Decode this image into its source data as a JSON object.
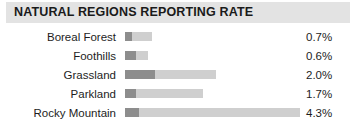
{
  "header": {
    "title": "NATURAL REGIONS REPORTING RATE",
    "band_color": "#e3e3e3",
    "text_color": "#1a1a1a"
  },
  "colors": {
    "bar_dark": "#8d8d8d",
    "bar_light": "#cfcfcf",
    "background": "#ffffff",
    "text": "#1d1d1d"
  },
  "chart_data": {
    "type": "bar",
    "title": "NATURAL REGIONS REPORTING RATE",
    "xlabel": "",
    "ylabel": "",
    "orientation": "horizontal",
    "grid": false,
    "legend": "none",
    "value_format": "percent",
    "xlim": [
      0,
      4.3
    ],
    "categories": [
      "Boreal Forest",
      "Foothills",
      "Grassland",
      "Parkland",
      "Rocky Mountain"
    ],
    "values": [
      0.7,
      0.6,
      2.0,
      1.7,
      4.3
    ],
    "value_labels": [
      "0.7%",
      "0.6%",
      "2.0%",
      "1.7%",
      "4.3%"
    ],
    "series": [
      {
        "name": "Reporting rate",
        "values": [
          0.7,
          0.6,
          2.0,
          1.7,
          4.3
        ]
      }
    ]
  },
  "rows": [
    {
      "label": "Boreal Forest",
      "value": "0.7%",
      "dark_px": 7,
      "light_left_px": 7,
      "light_width_px": 20
    },
    {
      "label": "Foothills",
      "value": "0.6%",
      "dark_px": 11,
      "light_left_px": 11,
      "light_width_px": 12
    },
    {
      "label": "Grassland",
      "value": "2.0%",
      "dark_px": 30,
      "light_left_px": 30,
      "light_width_px": 61
    },
    {
      "label": "Parkland",
      "value": "1.7%",
      "dark_px": 11,
      "light_left_px": 11,
      "light_width_px": 67
    },
    {
      "label": "Rocky Mountain",
      "value": "4.3%",
      "dark_px": 14,
      "light_left_px": 14,
      "light_width_px": 161
    }
  ]
}
